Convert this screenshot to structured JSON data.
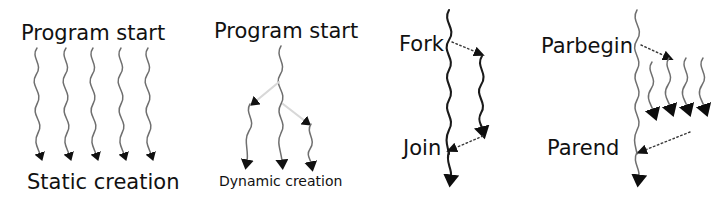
{
  "figure": {
    "background_color": "#ffffff",
    "line_color": "#6f6f6f",
    "dark_line_color": "#1a1a1a",
    "branch_color": "#d8d8d8",
    "text_color": "#111111",
    "width": 720,
    "height": 197
  },
  "panels": [
    {
      "id": "static-creation",
      "top_label": "Program start",
      "bottom_label": "Dynamic creation placeholder",
      "bottom_label_text": "Static creation",
      "thread_count": 5,
      "label_size": "large"
    },
    {
      "id": "dynamic-creation",
      "top_label": "Program start",
      "bottom_label_text": "Dynamic creation",
      "thread_count": 3,
      "label_size": "small"
    },
    {
      "id": "fork-join",
      "top_label": "Fork",
      "bottom_label_text": "Join",
      "thread_count": 2,
      "label_size": "large"
    },
    {
      "id": "parbegin-parend",
      "top_label": "Parbegin",
      "bottom_label_text": "Parend",
      "thread_count": 5,
      "label_size": "large"
    }
  ],
  "labels": {
    "static_program_start": "Program start",
    "static_creation": "Static creation",
    "dynamic_program_start": "Program start",
    "dynamic_creation": "Dynamic creation",
    "fork": "Fork",
    "join": "Join",
    "parbegin": "Parbegin",
    "parend": "Parend"
  }
}
